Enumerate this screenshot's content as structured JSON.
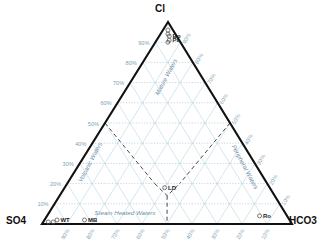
{
  "chart_data": {
    "type": "scatter",
    "plot_kind": "ternary",
    "title": "",
    "subtitle": "",
    "xlabel": "",
    "ylabel": "",
    "grid": true,
    "legend_position": "none",
    "axis_range": [
      0,
      100
    ],
    "tick_step": 10,
    "corners": {
      "top": "Cl",
      "bottom_left": "SO4",
      "bottom_right": "HCO3"
    },
    "axes": [
      {
        "name": "left-axis",
        "component": "Cl",
        "side": "left",
        "ticks": [
          "10%",
          "20%",
          "30%",
          "40%",
          "50%",
          "60%",
          "70%",
          "80%",
          "90%"
        ]
      },
      {
        "name": "right-axis",
        "component": "HCO3",
        "side": "right",
        "ticks": [
          "10%",
          "20%",
          "30%",
          "40%",
          "50%",
          "60%",
          "70%",
          "80%",
          "90%"
        ]
      },
      {
        "name": "bottom-axis",
        "component": "SO4",
        "side": "bottom",
        "ticks": [
          "90%",
          "80%",
          "70%",
          "60%",
          "50%",
          "40%",
          "30%",
          "20%",
          "10%"
        ]
      }
    ],
    "fields": [
      {
        "label": "Mature Waters",
        "rotation": -62,
        "x": 168,
        "y": 78
      },
      {
        "label": "Peripheral Waters",
        "rotation": 62,
        "x": 243,
        "y": 168
      },
      {
        "label": "Volcanic Waters",
        "rotation": -62,
        "x": 92,
        "y": 163
      },
      {
        "label": "Steam Heated Waters",
        "rotation": 0,
        "x": 125,
        "y": 215
      }
    ],
    "boundaries": [
      {
        "name": "volcanic-mature-boundary",
        "style": "dashed"
      },
      {
        "name": "peripheral-mature-boundary",
        "style": "dashed"
      },
      {
        "name": "steam-heated-boundary",
        "style": "dashed"
      }
    ],
    "series": [
      {
        "name": "samples",
        "marker": "open-circle",
        "color": "#555555",
        "points": [
          {
            "label": "",
            "cl": 96,
            "so4": 2,
            "hco3": 2
          },
          {
            "label": "",
            "cl": 94,
            "so4": 3,
            "hco3": 3
          },
          {
            "label": "Bp",
            "cl": 93,
            "so4": 3,
            "hco3": 4
          },
          {
            "label": "Pu",
            "cl": 91,
            "so4": 4,
            "hco3": 5
          },
          {
            "label": "",
            "cl": 90,
            "so4": 5,
            "hco3": 5
          },
          {
            "label": "LD",
            "cl": 18,
            "so4": 42,
            "hco3": 40
          },
          {
            "label": "Ro",
            "cl": 4,
            "so4": 11,
            "hco3": 85
          },
          {
            "label": "MB",
            "cl": 2,
            "so4": 82,
            "hco3": 16
          },
          {
            "label": "WT",
            "cl": 2,
            "so4": 93,
            "hco3": 5
          },
          {
            "label": "",
            "cl": 1,
            "so4": 97,
            "hco3": 2
          },
          {
            "label": "",
            "cl": 1,
            "so4": 95,
            "hco3": 4
          }
        ]
      }
    ],
    "colors": {
      "axis": "#111111",
      "grid": "#9fc7d8",
      "grid_dotted": "#8fb8cc",
      "tick_text": "#7f9fb5",
      "field_text": "#6f8fa5",
      "boundary": "#333333",
      "marker": "#555555"
    }
  }
}
